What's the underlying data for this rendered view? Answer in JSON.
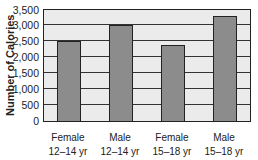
{
  "chart_data": {
    "type": "bar",
    "title": "",
    "xlabel": "",
    "ylabel": "Number of Calories",
    "categories": [
      "Female 12–14 yr",
      "Male 12–14 yr",
      "Female 15–18 yr",
      "Male 15–18 yr"
    ],
    "category_lines": [
      [
        "Female",
        "12–14 yr"
      ],
      [
        "Male",
        "12–14 yr"
      ],
      [
        "Female",
        "15–18 yr"
      ],
      [
        "Male",
        "15–18 yr"
      ]
    ],
    "values": [
      2500,
      3000,
      2400,
      3300
    ],
    "ylim": [
      0,
      3500
    ],
    "yticks": [
      0,
      500,
      1000,
      1500,
      2000,
      2500,
      3000,
      3500
    ],
    "ytick_labels": [
      "0",
      "500",
      "1,000",
      "1,500",
      "2,000",
      "2,500",
      "3,000",
      "3,500"
    ],
    "grid": true,
    "legend": null,
    "colors": {
      "bar": "#8c8c8c",
      "plot_bg": "#ebebeb",
      "axis": "#222222"
    }
  }
}
